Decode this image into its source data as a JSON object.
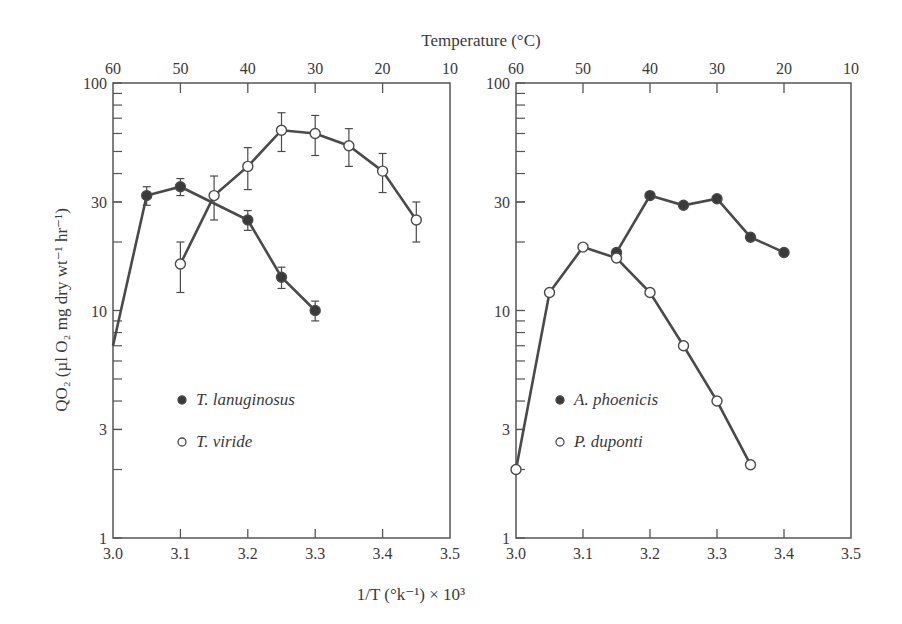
{
  "chart_data": [
    {
      "type": "line",
      "panel": "left",
      "title": "",
      "top_xlabel": "Temperature (°C)",
      "top_ticks": [
        "60",
        "50",
        "40",
        "30",
        "20",
        "10"
      ],
      "xlabel": "1/T (°k⁻¹) × 10³",
      "ylabel": "QO₂ (µl O₂ mg dry wt⁻¹ hr⁻¹)",
      "xlim": [
        3.0,
        3.5
      ],
      "ylim": [
        1,
        100
      ],
      "yscale": "log",
      "x_ticks": [
        "3.0",
        "3.1",
        "3.2",
        "3.3",
        "3.4",
        "3.5"
      ],
      "y_ticks": [
        "1",
        "3",
        "10",
        "30",
        "100"
      ],
      "grid": false,
      "legend_position": "lower-left inside",
      "series": [
        {
          "name": "T. lanuginosus",
          "marker": "filled-circle",
          "x": [
            3.0,
            3.05,
            3.1,
            3.2,
            3.25,
            3.3
          ],
          "values": [
            7,
            32,
            35,
            25,
            14,
            10
          ],
          "error_bars": [
            0,
            3,
            3,
            2.5,
            1.5,
            1
          ]
        },
        {
          "name": "T. viride",
          "marker": "open-circle",
          "x": [
            3.1,
            3.15,
            3.2,
            3.25,
            3.3,
            3.35,
            3.4,
            3.45
          ],
          "values": [
            16,
            32,
            43,
            62,
            60,
            53,
            41,
            25
          ],
          "error_bars": [
            4,
            7,
            9,
            12,
            12,
            10,
            8,
            5
          ]
        }
      ]
    },
    {
      "type": "line",
      "panel": "right",
      "title": "",
      "top_ticks": [
        "60",
        "50",
        "40",
        "30",
        "20",
        "10"
      ],
      "xlabel": "1/T (°k⁻¹) × 10³",
      "xlim": [
        3.0,
        3.5
      ],
      "ylim": [
        1,
        100
      ],
      "yscale": "log",
      "x_ticks": [
        "3.0",
        "3.1",
        "3.2",
        "3.3",
        "3.4",
        "3.5"
      ],
      "y_ticks": [
        "1",
        "3",
        "10",
        "30",
        "100"
      ],
      "grid": false,
      "legend_position": "lower-left inside",
      "series": [
        {
          "name": "A. phoenicis",
          "marker": "filled-circle",
          "x": [
            3.15,
            3.2,
            3.25,
            3.3,
            3.35,
            3.4
          ],
          "values": [
            18,
            32,
            29,
            31,
            21,
            18
          ]
        },
        {
          "name": "P. duponti",
          "marker": "open-circle",
          "x": [
            3.0,
            3.05,
            3.1,
            3.15,
            3.2,
            3.25,
            3.3,
            3.35
          ],
          "values": [
            2,
            12,
            19,
            17,
            12,
            7,
            4,
            2.1
          ]
        }
      ]
    }
  ],
  "labels": {
    "top_axis_title": "Temperature (°C)",
    "bottom_axis_title": "1/T (°k⁻¹) × 10³",
    "y_axis_title": "QO₂ (µl O₂ mg dry wt⁻¹ hr⁻¹)"
  },
  "colors": {
    "line": "#4a4a4a",
    "marker_filled": "#3a3a3a",
    "marker_open_fill": "#ffffff",
    "axis": "#555555",
    "text": "#3a3a3a"
  }
}
